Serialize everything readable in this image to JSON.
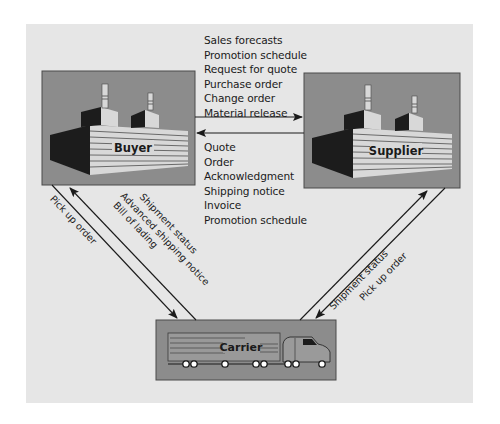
{
  "colors": {
    "panel_bg": "#e6e6e6",
    "box_fill": "#8c8c8c",
    "box_border": "#4a4a4a",
    "factory_dark": "#1c1c1c",
    "factory_light": "#d8d8d8",
    "line": "#1a1a1a"
  },
  "entities": {
    "buyer": {
      "label": "Buyer",
      "icon": "factory-icon"
    },
    "supplier": {
      "label": "Supplier",
      "icon": "factory-icon"
    },
    "carrier": {
      "label": "Carrier",
      "icon": "truck-icon"
    }
  },
  "flows": {
    "buyer_to_supplier": {
      "direction": "Buyer → Supplier",
      "items": [
        "Sales forecasts",
        "Promotion schedule",
        "Request for quote",
        "Purchase order",
        "Change order",
        "Material release"
      ]
    },
    "supplier_to_buyer": {
      "direction": "Supplier → Buyer",
      "items": [
        "Quote",
        "Order",
        "Acknowledgment",
        "Shipping notice",
        "Invoice",
        "Promotion schedule"
      ]
    },
    "buyer_to_carrier": {
      "direction": "Buyer → Carrier",
      "items": [
        "Pick up order"
      ]
    },
    "carrier_to_buyer": {
      "direction": "Carrier → Buyer",
      "items": [
        "Shipment status",
        "Advanced shipping notice",
        "Bill of lading"
      ]
    },
    "carrier_to_supplier": {
      "direction": "Carrier → Supplier",
      "items": [
        "Shipment status"
      ]
    },
    "supplier_to_carrier": {
      "direction": "Supplier → Carrier",
      "items": [
        "Pick up order"
      ]
    }
  }
}
